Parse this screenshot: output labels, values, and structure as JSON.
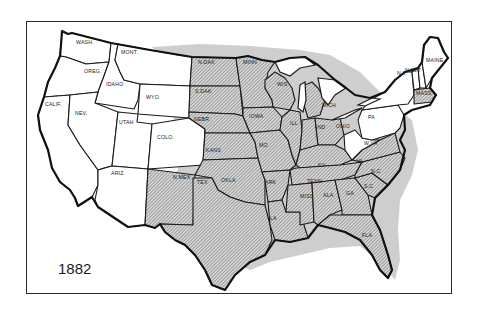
{
  "map": {
    "year": "1882",
    "legend_meaning": {
      "hatched": "shaded region",
      "unshaded": "white region"
    },
    "colors": {
      "outline": "#1a1a1a",
      "hatch": "#6e6e6e",
      "halo": "#bdbdbd",
      "background": "#ffffff"
    },
    "state_labels": [
      {
        "id": "wash",
        "label": "WASH.",
        "x": 76,
        "y": 44
      },
      {
        "id": "mont",
        "label": "MONT.",
        "x": 121,
        "y": 54
      },
      {
        "id": "oreg",
        "label": "OREG.",
        "x": 84,
        "y": 73
      },
      {
        "id": "idaho",
        "label": "IDAHO",
        "x": 106,
        "y": 86
      },
      {
        "id": "wyo",
        "label": "WYO.",
        "x": 146,
        "y": 99
      },
      {
        "id": "calif",
        "label": "CALIF.",
        "x": 45,
        "y": 106
      },
      {
        "id": "nev",
        "label": "NEV.",
        "x": 75,
        "y": 115
      },
      {
        "id": "utah",
        "label": "UTAH",
        "x": 119,
        "y": 124
      },
      {
        "id": "colo",
        "label": "COLO.",
        "x": 157,
        "y": 139
      },
      {
        "id": "ariz",
        "label": "ARIZ.",
        "x": 111,
        "y": 175
      },
      {
        "id": "nmex",
        "label": "N.MEX",
        "x": 173,
        "y": 179
      },
      {
        "id": "ndak",
        "label": "N.DAK",
        "x": 198,
        "y": 64
      },
      {
        "id": "sdak",
        "label": "S.DAK",
        "x": 195,
        "y": 93
      },
      {
        "id": "nebr",
        "label": "NEBR.",
        "x": 194,
        "y": 121
      },
      {
        "id": "kans",
        "label": "KANS",
        "x": 206,
        "y": 152
      },
      {
        "id": "okla",
        "label": "OKLA",
        "x": 221,
        "y": 182
      },
      {
        "id": "tex",
        "label": "TEX",
        "x": 197,
        "y": 184
      },
      {
        "id": "minn",
        "label": "MINN",
        "x": 243,
        "y": 64
      },
      {
        "id": "iowa",
        "label": "IOWA",
        "x": 249,
        "y": 118
      },
      {
        "id": "mo",
        "label": "MO",
        "x": 259,
        "y": 147
      },
      {
        "id": "ark",
        "label": "ARK",
        "x": 265,
        "y": 184
      },
      {
        "id": "la",
        "label": "LA",
        "x": 270,
        "y": 220
      },
      {
        "id": "wis",
        "label": "WIS",
        "x": 277,
        "y": 86
      },
      {
        "id": "ill",
        "label": "ILL",
        "x": 290,
        "y": 125
      },
      {
        "id": "mich",
        "label": "MICH",
        "x": 322,
        "y": 107
      },
      {
        "id": "ind",
        "label": "IND",
        "x": 316,
        "y": 129
      },
      {
        "id": "ohio",
        "label": "OHIO",
        "x": 336,
        "y": 128
      },
      {
        "id": "ky",
        "label": "KY",
        "x": 318,
        "y": 167
      },
      {
        "id": "tenn",
        "label": "TENN",
        "x": 307,
        "y": 183
      },
      {
        "id": "miss",
        "label": "MISS",
        "x": 300,
        "y": 198
      },
      {
        "id": "ala",
        "label": "ALA",
        "x": 323,
        "y": 197
      },
      {
        "id": "ga",
        "label": "GA",
        "x": 346,
        "y": 195
      },
      {
        "id": "sc",
        "label": "S.C",
        "x": 364,
        "y": 188
      },
      {
        "id": "fla",
        "label": "FLA",
        "x": 362,
        "y": 237
      },
      {
        "id": "nc",
        "label": "N.C",
        "x": 371,
        "y": 173
      },
      {
        "id": "va",
        "label": "VA",
        "x": 356,
        "y": 163
      },
      {
        "id": "wva",
        "label": "W.VA",
        "x": 364,
        "y": 145
      },
      {
        "id": "pa",
        "label": "PA",
        "x": 368,
        "y": 119
      },
      {
        "id": "ny",
        "label": "N.Y.",
        "x": 397,
        "y": 75
      },
      {
        "id": "vt",
        "label": "VT",
        "x": 414,
        "y": 72
      },
      {
        "id": "nh",
        "label": "N.H.",
        "x": 405,
        "y": 72
      },
      {
        "id": "maine",
        "label": "MAINE",
        "x": 426,
        "y": 62
      },
      {
        "id": "mass",
        "label": "MASS",
        "x": 416,
        "y": 95
      }
    ]
  }
}
